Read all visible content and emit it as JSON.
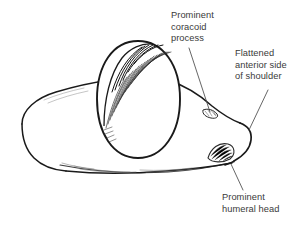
{
  "figure": {
    "background_color": "#ffffff",
    "ink_color": "#1a1a1a",
    "text_color": "#3a3a3a",
    "shading_color": "#555555"
  },
  "labels": {
    "coracoid": {
      "name": "prominent-coracoid-process",
      "lines": [
        "Prominent",
        "coracoid",
        "process"
      ],
      "line1": "Prominent",
      "line2": "coracoid",
      "line3": "process"
    },
    "flattened": {
      "name": "flattened-anterior-side-of-shoulder",
      "lines": [
        "Flattened",
        "anterior side",
        "of shoulder"
      ],
      "line1": "Flattened",
      "line2": "anterior side",
      "line3": "of shoulder"
    },
    "humeral": {
      "name": "prominent-humeral-head",
      "lines": [
        "Prominent",
        "humeral head"
      ],
      "line1": "Prominent",
      "line2": "humeral head"
    }
  },
  "anatomy": {
    "shoulder_outline": "irregular rounded mass spanning left to right",
    "coracoid_egg": "large vertical oval with dense hatching on upper-left rim",
    "humeral_head_bump": "small hatched convexity at lower right",
    "coracoid_notch": "small hatched notch on upper right contour",
    "ground_shadow": "light horizontal shading along lower edge"
  },
  "leader_lines": {
    "coracoid_leader": "from text down-left to notch on upper right contour",
    "flattened_leader": "from text down-left to flattened right edge",
    "humeral_leader": "from humeral bump down-right to text"
  }
}
